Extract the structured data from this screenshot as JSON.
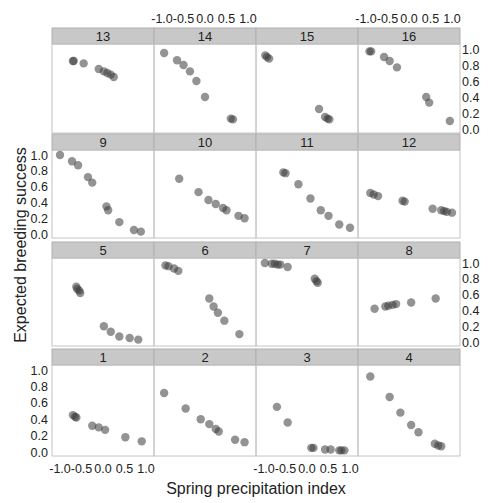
{
  "chart_data": {
    "type": "scatter",
    "layout": "lattice 4x4 panels",
    "xlabel": "Spring precipitation index",
    "ylabel": "Expected breeding success",
    "xlim": [
      -1.1,
      1.1
    ],
    "ylim": [
      -0.05,
      1.05
    ],
    "xticks": [
      "-1.0",
      "-0.5",
      "0.0",
      "0.5",
      "1.0"
    ],
    "yticks": [
      "0.0",
      "0.2",
      "0.4",
      "0.6",
      "0.8",
      "1.0"
    ],
    "strip_color": "#c8c8c8",
    "point_color": "#555555",
    "panels": [
      {
        "label": "13",
        "x": [
          -0.7,
          -0.68,
          -0.45,
          -0.1,
          0.02,
          0.1,
          0.18,
          0.25
        ],
        "y": [
          0.85,
          0.85,
          0.82,
          0.75,
          0.72,
          0.7,
          0.68,
          0.65
        ]
      },
      {
        "label": "14",
        "x": [
          -0.95,
          -0.65,
          -0.5,
          -0.35,
          -0.2,
          0.0,
          0.6,
          0.65
        ],
        "y": [
          0.95,
          0.86,
          0.8,
          0.72,
          0.6,
          0.4,
          0.13,
          0.12
        ]
      },
      {
        "label": "15",
        "x": [
          -0.97,
          -0.93,
          -0.88,
          0.28,
          0.42,
          0.48,
          0.52
        ],
        "y": [
          0.92,
          0.9,
          0.88,
          0.25,
          0.15,
          0.13,
          0.12
        ]
      },
      {
        "label": "16",
        "x": [
          -0.92,
          -0.88,
          -0.58,
          -0.45,
          -0.28,
          0.4,
          0.47,
          0.95
        ],
        "y": [
          0.97,
          0.97,
          0.9,
          0.85,
          0.77,
          0.4,
          0.33,
          0.1
        ]
      },
      {
        "label": "9",
        "x": [
          -1.0,
          -0.72,
          -0.58,
          -0.35,
          -0.25,
          0.08,
          0.12,
          0.38,
          0.72,
          0.88
        ],
        "y": [
          1.0,
          0.92,
          0.87,
          0.72,
          0.65,
          0.35,
          0.3,
          0.15,
          0.05,
          0.03
        ]
      },
      {
        "label": "10",
        "x": [
          -0.6,
          -0.15,
          0.08,
          0.25,
          0.42,
          0.5,
          0.78,
          0.92
        ],
        "y": [
          0.7,
          0.53,
          0.43,
          0.38,
          0.33,
          0.3,
          0.23,
          0.2
        ]
      },
      {
        "label": "11",
        "x": [
          -0.55,
          -0.5,
          -0.2,
          0.08,
          0.32,
          0.5,
          0.75,
          1.0
        ],
        "y": [
          0.78,
          0.77,
          0.63,
          0.45,
          0.3,
          0.23,
          0.12,
          0.08
        ]
      },
      {
        "label": "12",
        "x": [
          -0.9,
          -0.82,
          -0.72,
          -0.15,
          -0.1,
          0.55,
          0.75,
          0.82,
          0.88,
          1.0
        ],
        "y": [
          0.52,
          0.5,
          0.48,
          0.42,
          0.41,
          0.32,
          0.3,
          0.29,
          0.28,
          0.27
        ]
      },
      {
        "label": "5",
        "x": [
          -0.62,
          -0.6,
          -0.55,
          -0.53,
          0.02,
          0.18,
          0.38,
          0.62,
          0.82
        ],
        "y": [
          0.7,
          0.67,
          0.65,
          0.62,
          0.2,
          0.13,
          0.07,
          0.05,
          0.03
        ]
      },
      {
        "label": "6",
        "x": [
          -0.92,
          -0.85,
          -0.72,
          -0.62,
          0.1,
          0.2,
          0.3,
          0.45,
          0.8
        ],
        "y": [
          0.97,
          0.96,
          0.93,
          0.9,
          0.55,
          0.45,
          0.37,
          0.27,
          0.1
        ]
      },
      {
        "label": "7",
        "x": [
          -0.98,
          -0.82,
          -0.75,
          -0.68,
          -0.62,
          -0.45,
          0.18,
          0.22,
          0.25
        ],
        "y": [
          1.0,
          0.99,
          0.99,
          0.98,
          0.98,
          0.95,
          0.8,
          0.77,
          0.75
        ]
      },
      {
        "label": "8",
        "x": [
          -0.8,
          -0.55,
          -0.48,
          -0.38,
          -0.3,
          0.05,
          0.62
        ],
        "y": [
          0.42,
          0.45,
          0.46,
          0.47,
          0.48,
          0.5,
          0.55
        ]
      },
      {
        "label": "1",
        "x": [
          -0.7,
          -0.65,
          -0.62,
          -0.25,
          -0.1,
          0.05,
          0.52,
          0.9
        ],
        "y": [
          0.45,
          0.43,
          0.42,
          0.32,
          0.3,
          0.27,
          0.18,
          0.13
        ]
      },
      {
        "label": "2",
        "x": [
          -0.95,
          -0.45,
          -0.1,
          0.1,
          0.25,
          0.32,
          0.7,
          0.92
        ],
        "y": [
          0.72,
          0.53,
          0.4,
          0.34,
          0.28,
          0.25,
          0.15,
          0.12
        ]
      },
      {
        "label": "3",
        "x": [
          -0.7,
          -0.45,
          0.1,
          0.15,
          0.42,
          0.55,
          0.75,
          0.8,
          0.87
        ],
        "y": [
          0.55,
          0.36,
          0.05,
          0.05,
          0.03,
          0.03,
          0.02,
          0.02,
          0.02
        ]
      },
      {
        "label": "4",
        "x": [
          -0.9,
          -0.45,
          -0.2,
          0.05,
          0.22,
          0.6,
          0.68,
          0.75
        ],
        "y": [
          0.92,
          0.67,
          0.48,
          0.33,
          0.24,
          0.1,
          0.08,
          0.07
        ]
      }
    ]
  }
}
